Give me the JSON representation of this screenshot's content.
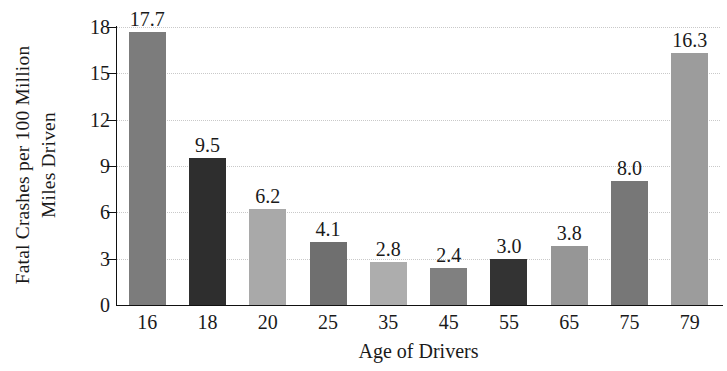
{
  "chart_data": {
    "type": "bar",
    "title": "",
    "xlabel": "Age of Drivers",
    "ylabel_line1": "Fatal Crashes per 100 Million",
    "ylabel_line2": "Miles Driven",
    "categories": [
      "16",
      "18",
      "20",
      "25",
      "35",
      "45",
      "55",
      "65",
      "75",
      "79"
    ],
    "values": [
      17.7,
      9.5,
      6.2,
      4.1,
      2.8,
      2.4,
      3.0,
      3.8,
      8.0,
      16.3
    ],
    "value_labels": [
      "17.7",
      "9.5",
      "6.2",
      "4.1",
      "2.8",
      "2.4",
      "3.0",
      "3.8",
      "8.0",
      "16.3"
    ],
    "bar_colors": [
      "#7c7c7c",
      "#2e2e2e",
      "#a9a9a9",
      "#6f6f6f",
      "#adadad",
      "#808080",
      "#333333",
      "#969696",
      "#777777",
      "#9c9c9c"
    ],
    "ylim": [
      0,
      18
    ],
    "yticks": [
      0,
      3,
      6,
      9,
      12,
      15,
      18
    ],
    "ytick_labels": [
      "0",
      "3",
      "6",
      "9",
      "12",
      "15",
      "18"
    ],
    "grid": true,
    "grid_color": "#c9c9c9",
    "legend": false,
    "axis_color": "#111111"
  }
}
